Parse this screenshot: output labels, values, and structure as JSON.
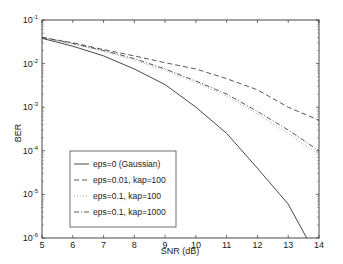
{
  "chart_data": {
    "type": "line",
    "title": "",
    "xlabel": "SNR (dB)",
    "ylabel": "BER",
    "yscale": "log",
    "xlim": [
      5,
      14
    ],
    "ylim": [
      1e-06,
      0.1
    ],
    "xticks": [
      "5",
      "6",
      "7",
      "8",
      "9",
      "10",
      "11",
      "12",
      "13",
      "14"
    ],
    "yticks": [
      {
        "base": "10",
        "exp": "-1"
      },
      {
        "base": "10",
        "exp": "-2"
      },
      {
        "base": "10",
        "exp": "-3"
      },
      {
        "base": "10",
        "exp": "-4"
      },
      {
        "base": "10",
        "exp": "-5"
      },
      {
        "base": "10",
        "exp": "-6"
      }
    ],
    "grid": false,
    "legend_position": "lower left (inside)",
    "x": [
      5,
      6,
      7,
      8,
      9,
      10,
      11,
      12,
      13,
      14
    ],
    "series": [
      {
        "name": "eps=0  (Gaussian)",
        "style": "solid",
        "x": [
          5,
          6,
          7,
          8,
          9,
          10,
          11,
          12,
          13,
          13.6
        ],
        "values": [
          0.038,
          0.025,
          0.015,
          0.0075,
          0.0033,
          0.001,
          0.00025,
          4e-05,
          6e-06,
          1e-06
        ]
      },
      {
        "name": "eps=0.01, kap=100",
        "style": "dashed",
        "values": [
          0.04,
          0.03,
          0.021,
          0.015,
          0.0105,
          0.0075,
          0.0045,
          0.0025,
          0.001,
          0.0005
        ]
      },
      {
        "name": "eps=0.1, kap=100",
        "style": "dotted",
        "values": [
          0.04,
          0.028,
          0.019,
          0.012,
          0.007,
          0.0037,
          0.0018,
          0.0007,
          0.00025,
          8e-05
        ]
      },
      {
        "name": "eps=0.1, kap=1000",
        "style": "dashdot",
        "values": [
          0.04,
          0.029,
          0.02,
          0.013,
          0.0075,
          0.004,
          0.002,
          0.0008,
          0.0003,
          0.0001
        ]
      }
    ]
  }
}
